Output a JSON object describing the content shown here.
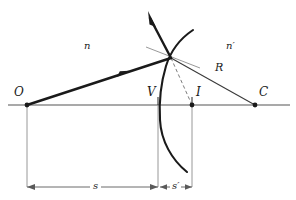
{
  "figure": {
    "colors": {
      "ray": "#1a1a1a",
      "surface": "#1a1a1a",
      "axis": "#8c8c8c",
      "construction": "#8c8c8c",
      "dashed": "#8c8c8c",
      "text": "#1a1a1a",
      "background": "#ffffff"
    },
    "labels": {
      "object_point": "O",
      "vertex": "V",
      "image_point": "I",
      "center_of_curvature": "C",
      "index_left": "n",
      "index_right": "n′",
      "radius": "R",
      "object_distance": "s",
      "image_distance": "s′"
    },
    "geometry": {
      "axis_y": 105,
      "object_x": 27,
      "vertex_x": 158,
      "image_x": 192,
      "center_x": 255,
      "refraction_point": {
        "x": 171,
        "y": 58
      },
      "dimension_y": 187
    },
    "elements": {
      "optical_axis": "optical-axis",
      "incident_ray": "incident-ray",
      "refracted_ray": "refracted-ray",
      "normal_line": "normal-radius-line",
      "spherical_surface": "spherical-surface-arc",
      "dashed_image_ray": "dashed-image-ray",
      "tangent_line": "tangent-line"
    }
  }
}
